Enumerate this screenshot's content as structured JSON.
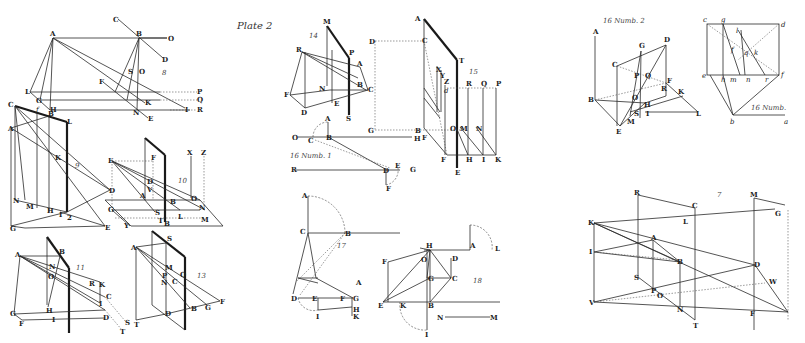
{
  "plate": {
    "title": "Plate 2",
    "background": "#ffffff",
    "ink": "#222222"
  },
  "figures": [
    {
      "id": "fig8",
      "number": "8",
      "labels": [
        "A",
        "B",
        "C",
        "D",
        "O",
        "F",
        "L",
        "G",
        "H",
        "K",
        "N",
        "E",
        "P",
        "Q",
        "R",
        "I",
        "S",
        "V",
        "e"
      ]
    },
    {
      "id": "fig9",
      "number": "9",
      "labels": [
        "C",
        "A",
        "f",
        "B",
        "L",
        "K",
        "D",
        "N",
        "M",
        "H",
        "I",
        "G",
        "E",
        "2"
      ]
    },
    {
      "id": "fig10",
      "number": "10",
      "labels": [
        "E",
        "F",
        "X",
        "Z",
        "D",
        "V",
        "A",
        "G",
        "S",
        "T",
        "B",
        "L",
        "M",
        "N",
        "O",
        "Y"
      ]
    },
    {
      "id": "fig11",
      "number": "11",
      "labels": [
        "A",
        "B",
        "N",
        "O",
        "R",
        "K",
        "C",
        "I",
        "H",
        "G",
        "F",
        "D",
        "S",
        "T"
      ]
    },
    {
      "id": "fig13",
      "number": "13",
      "labels": [
        "A",
        "S",
        "M",
        "P",
        "N",
        "C",
        "O",
        "B",
        "G",
        "F",
        "T",
        "D"
      ]
    },
    {
      "id": "fig14",
      "number": "14",
      "labels": [
        "M",
        "R",
        "P",
        "A",
        "N",
        "B",
        "C",
        "F",
        "E",
        "D",
        "S"
      ]
    },
    {
      "id": "fig15",
      "number": "15",
      "labels": [
        "A",
        "C",
        "D",
        "T",
        "X",
        "Y",
        "Z",
        "B",
        "F",
        "G",
        "d",
        "R",
        "Q",
        "P",
        "O",
        "M",
        "N",
        "H",
        "I",
        "K",
        "E"
      ]
    },
    {
      "id": "fig16n1",
      "number": "16 Numb. 1",
      "labels": [
        "A",
        "O",
        "C",
        "B",
        "H",
        "R",
        "D",
        "E",
        "G",
        "F"
      ]
    },
    {
      "id": "fig16n2",
      "number": "16 Numb. 2",
      "labels": [
        "A",
        "D",
        "G",
        "C",
        "P",
        "Q",
        "F",
        "R",
        "B",
        "O",
        "H",
        "K",
        "S",
        "I",
        "L",
        "M",
        "E"
      ]
    },
    {
      "id": "fig16n3",
      "number": "16 Numb.",
      "labels": [
        "c",
        "g",
        "d",
        "l",
        "f",
        "q",
        "k",
        "e",
        "h",
        "m",
        "n",
        "r",
        "b",
        "a"
      ]
    },
    {
      "id": "fig17",
      "number": "17",
      "labels": [
        "A",
        "C",
        "B",
        "D",
        "E",
        "F",
        "G",
        "H",
        "I",
        "K"
      ]
    },
    {
      "id": "fig18",
      "number": "18",
      "labels": [
        "H",
        "A",
        "L",
        "F",
        "O",
        "D",
        "G",
        "C",
        "E",
        "K",
        "B",
        "N",
        "M",
        "I"
      ]
    },
    {
      "id": "fig7",
      "number": "7",
      "labels": [
        "R",
        "C",
        "M",
        "G",
        "K",
        "L",
        "A",
        "I",
        "B",
        "D",
        "S",
        "P",
        "O",
        "W",
        "V",
        "N",
        "T",
        "F"
      ]
    }
  ]
}
